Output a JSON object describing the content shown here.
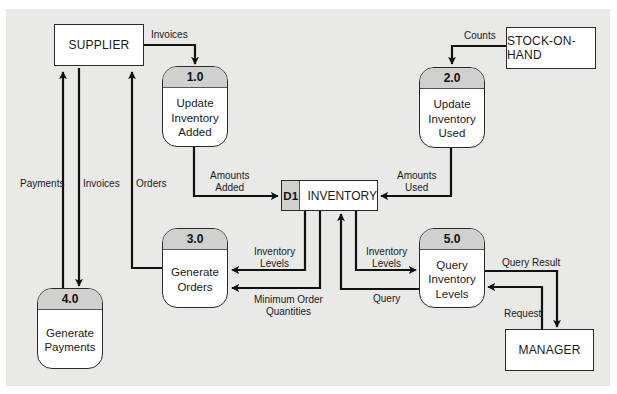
{
  "diagram": {
    "type": "data-flow-diagram",
    "colors": {
      "background_panel": "#e9e9e8",
      "process_header": "#d0d0ce",
      "line": "#111111",
      "box": "#ffffff"
    },
    "entities": {
      "supplier": "SUPPLIER",
      "stock_on_hand": "STOCK-ON-HAND",
      "manager": "MANAGER"
    },
    "processes": [
      {
        "id": "1.0",
        "name": "Update Inventory Added"
      },
      {
        "id": "2.0",
        "name": "Update Inventory Used"
      },
      {
        "id": "3.0",
        "name": "Generate Orders"
      },
      {
        "id": "4.0",
        "name": "Generate Payments"
      },
      {
        "id": "5.0",
        "name": "Query Inventory Levels"
      }
    ],
    "data_store": {
      "id": "D1",
      "name": "INVENTORY"
    },
    "flows": {
      "supplier_invoices_to_1": "Invoices",
      "stock_counts_to_2": "Counts",
      "amounts_added": [
        "Amounts",
        "Added"
      ],
      "amounts_used": [
        "Amounts",
        "Used"
      ],
      "payments": "Payments",
      "invoices_to_4": "Invoices",
      "orders": "Orders",
      "inventory_levels_to_3": [
        "Inventory",
        "Levels"
      ],
      "min_order_qty": [
        "Minimum Order",
        "Quantities"
      ],
      "inventory_levels_to_5": [
        "Inventory",
        "Levels"
      ],
      "query": "Query",
      "query_result": "Query Result",
      "request": "Request"
    }
  }
}
